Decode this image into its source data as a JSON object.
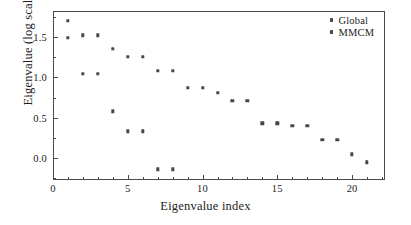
{
  "chart_data": {
    "type": "scatter",
    "title": "",
    "xlabel": "Eigenvalue index",
    "ylabel": "Eigenvalue (log scale)",
    "xlim": [
      0,
      22.2
    ],
    "ylim": [
      -0.27,
      1.82
    ],
    "xticks": [
      0,
      5,
      10,
      15,
      20
    ],
    "xtick_labels": [
      "0",
      "5",
      "10",
      "15",
      "20"
    ],
    "xticks_minor": [
      1,
      2,
      3,
      4,
      6,
      7,
      8,
      9,
      11,
      12,
      13,
      14,
      16,
      17,
      18,
      19,
      21,
      22
    ],
    "yticks": [
      0.0,
      0.5,
      1.0,
      1.5
    ],
    "ytick_labels": [
      "0.0",
      "0.5",
      "1.0",
      "1.5"
    ],
    "yticks_minor": [
      -0.25,
      0.25,
      0.75,
      1.25,
      1.75
    ],
    "grid": false,
    "legend_position": "top-right",
    "marker": "square",
    "marker_color": "#46464e",
    "frame_color": "#4a4a4a",
    "series": [
      {
        "name": "Global",
        "color": "#46464e",
        "x": [
          1,
          2,
          3,
          4,
          5,
          6,
          7,
          8,
          9,
          10,
          11,
          12,
          13,
          14,
          15,
          16,
          17,
          18,
          19,
          20,
          21
        ],
        "values": [
          1.7,
          1.52,
          1.52,
          1.35,
          1.25,
          1.25,
          1.08,
          1.08,
          0.87,
          0.87,
          0.81,
          0.71,
          0.71,
          0.43,
          0.43,
          0.4,
          0.4,
          0.23,
          0.23,
          0.05,
          -0.05
        ]
      },
      {
        "name": "MMCM",
        "color": "#46464e",
        "x": [
          1,
          2,
          3,
          4,
          5,
          6,
          7,
          8
        ],
        "values": [
          1.49,
          1.04,
          1.04,
          0.58,
          0.33,
          0.33,
          -0.14,
          -0.14
        ]
      }
    ]
  }
}
